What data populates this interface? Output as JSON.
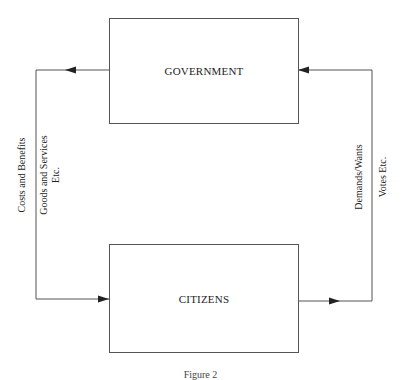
{
  "diagram": {
    "nodes": [
      {
        "id": "government",
        "label": "GOVERNMENT"
      },
      {
        "id": "citizens",
        "label": "CITIZENS"
      }
    ],
    "edges": [
      {
        "from": "government",
        "to": "citizens",
        "side": "left",
        "labels": [
          "Costs and Benefits",
          "Goods and Services",
          "Etc."
        ]
      },
      {
        "from": "citizens",
        "to": "government",
        "side": "right",
        "labels": [
          "Demands/Wants",
          "Votes Etc."
        ]
      }
    ],
    "left_labels": {
      "line1": "Costs and Benefits",
      "line2": "Goods and Services",
      "line3": "Etc."
    },
    "right_labels": {
      "line1": "Demands/Wants",
      "line2": "Votes Etc."
    },
    "caption": "Figure 2",
    "colors": {
      "line": "#555555",
      "text": "#222222",
      "background": "#ffffff"
    }
  }
}
